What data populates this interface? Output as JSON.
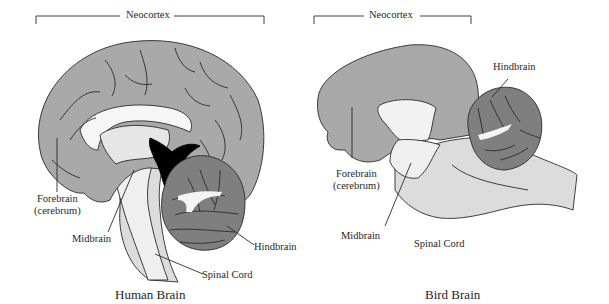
{
  "figure": {
    "panels": [
      {
        "id": "human",
        "title": "Human Brain",
        "bracket_label": "Neocortex",
        "labels": {
          "forebrain": "Forebrain",
          "forebrain_sub": "(cerebrum)",
          "midbrain": "Midbrain",
          "hindbrain": "Hindbrain",
          "spinal_cord": "Spinal Cord"
        }
      },
      {
        "id": "bird",
        "title": "Bird Brain",
        "bracket_label": "Neocortex",
        "labels": {
          "forebrain": "Forebrain",
          "forebrain_sub": "(cerebrum)",
          "midbrain": "Midbrain",
          "hindbrain": "Hindbrain",
          "spinal_cord": "Spinal Cord"
        }
      }
    ],
    "colors": {
      "forebrain": "#a9a9a9",
      "hindbrain": "#7f7f7f",
      "midbrain": "#efefef",
      "spinal_cord": "#dcdcdc",
      "ventricle": "#000000",
      "outline": "#2a2a2a"
    }
  }
}
